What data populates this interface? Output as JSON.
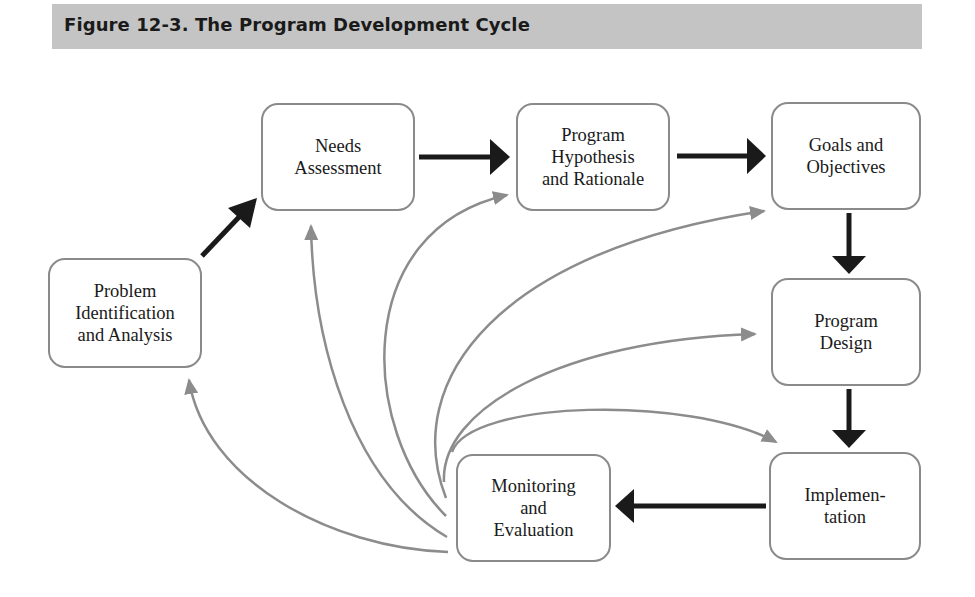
{
  "figure": {
    "title": "Figure 12-3. The Program Development Cycle"
  },
  "nodes": {
    "problem": {
      "label": "Problem\nIdentification\nand Analysis"
    },
    "needs": {
      "label": "Needs\nAssessment"
    },
    "hypothesis": {
      "label": "Program\nHypothesis\nand Rationale"
    },
    "goals": {
      "label": "Goals and\nObjectives"
    },
    "design": {
      "label": "Program\nDesign"
    },
    "implementation": {
      "label": "Implemen-\ntation"
    },
    "monitoring": {
      "label": "Monitoring\nand\nEvaluation"
    }
  },
  "edges": {
    "primary": [
      {
        "from": "Problem Identification and Analysis",
        "to": "Needs Assessment"
      },
      {
        "from": "Needs Assessment",
        "to": "Program Hypothesis and Rationale"
      },
      {
        "from": "Program Hypothesis and Rationale",
        "to": "Goals and Objectives"
      },
      {
        "from": "Goals and Objectives",
        "to": "Program Design"
      },
      {
        "from": "Program Design",
        "to": "Implementation"
      },
      {
        "from": "Implementation",
        "to": "Monitoring and Evaluation"
      }
    ],
    "feedback": [
      {
        "from": "Monitoring and Evaluation",
        "to": "Problem Identification and Analysis"
      },
      {
        "from": "Monitoring and Evaluation",
        "to": "Needs Assessment"
      },
      {
        "from": "Monitoring and Evaluation",
        "to": "Program Hypothesis and Rationale"
      },
      {
        "from": "Monitoring and Evaluation",
        "to": "Goals and Objectives"
      },
      {
        "from": "Monitoring and Evaluation",
        "to": "Program Design"
      },
      {
        "from": "Monitoring and Evaluation",
        "to": "Implementation"
      }
    ]
  },
  "colors": {
    "banner": "#c4c4c4",
    "primary_arrow": "#1a1a1a",
    "feedback_arrow": "#8c8c8c",
    "node_border": "#8a8a8a"
  }
}
